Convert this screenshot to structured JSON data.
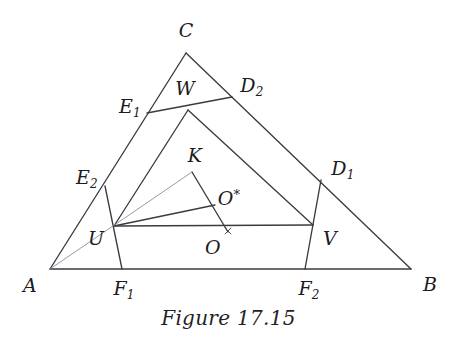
{
  "figure": {
    "caption": "Figure 17.15",
    "background_color": "#ffffff",
    "stroke_color": "#3a3a42",
    "light_stroke_color": "#8d8d96",
    "label_color": "#1b1b20"
  },
  "labels": {
    "A": "A",
    "B": "B",
    "C": "C",
    "U": "U",
    "V": "V",
    "W": "W",
    "K": "K",
    "O": "O",
    "O_star_base": "O",
    "O_star_mark": "*",
    "E1_base": "E",
    "E1_sub": "1",
    "E2_base": "E",
    "E2_sub": "2",
    "D1_base": "D",
    "D1_sub": "1",
    "D2_base": "D",
    "D2_sub": "2",
    "F1_base": "F",
    "F1_sub": "1",
    "F2_base": "F",
    "F2_sub": "2"
  },
  "chart_data": {
    "type": "diagram",
    "title": "Figure 17.15",
    "points": {
      "A": {
        "x": 50,
        "y": 269
      },
      "B": {
        "x": 411,
        "y": 269
      },
      "C": {
        "x": 186,
        "y": 53
      },
      "U": {
        "x": 114,
        "y": 226
      },
      "V": {
        "x": 313,
        "y": 225
      },
      "W": {
        "x": 188,
        "y": 110
      },
      "K": {
        "x": 192,
        "y": 172
      },
      "O": {
        "x": 228,
        "y": 232
      },
      "Ostar": {
        "x": 215,
        "y": 205
      },
      "E1": {
        "x": 147,
        "y": 113
      },
      "E2": {
        "x": 105,
        "y": 186
      },
      "D1": {
        "x": 321,
        "y": 180
      },
      "D2": {
        "x": 232,
        "y": 97
      },
      "F1": {
        "x": 122,
        "y": 269
      },
      "F2": {
        "x": 305,
        "y": 269
      }
    },
    "segments": [
      {
        "name": "side-AB",
        "from": "A",
        "to": "B",
        "weight": "normal"
      },
      {
        "name": "side-AC",
        "from": "A",
        "to": "C",
        "weight": "normal"
      },
      {
        "name": "side-CB",
        "from": "C",
        "to": "B",
        "weight": "normal"
      },
      {
        "name": "chord-E1-D2",
        "from": "E1",
        "to": "D2",
        "weight": "normal"
      },
      {
        "name": "chord-U-V",
        "from": "U",
        "to": "V",
        "weight": "normal"
      },
      {
        "name": "chord-E2-F1",
        "from": "E2",
        "to": "F1",
        "weight": "normal"
      },
      {
        "name": "chord-D1-F2",
        "from": "D1",
        "to": "F2",
        "weight": "normal"
      },
      {
        "name": "segment-U-W",
        "from": "U",
        "to": "W",
        "weight": "normal"
      },
      {
        "name": "segment-W-V",
        "from": "W",
        "to": "V",
        "weight": "normal"
      },
      {
        "name": "segment-U-Ostar",
        "from": "U",
        "to": "Ostar",
        "weight": "normal"
      },
      {
        "name": "segment-K-O",
        "from": "K",
        "to": "O",
        "weight": "normal"
      },
      {
        "name": "segment-U-K-light",
        "from": "A",
        "to": "K",
        "weight": "light"
      }
    ],
    "marks": [
      {
        "name": "cross-mark-O",
        "x": 228,
        "y": 231
      }
    ],
    "label_positions": {
      "A": {
        "x": 30,
        "y": 285
      },
      "B": {
        "x": 430,
        "y": 284
      },
      "C": {
        "x": 186,
        "y": 30
      },
      "U": {
        "x": 96,
        "y": 238
      },
      "V": {
        "x": 330,
        "y": 238
      },
      "W": {
        "x": 185,
        "y": 88
      },
      "K": {
        "x": 195,
        "y": 155
      },
      "O": {
        "x": 213,
        "y": 247
      },
      "Ostar": {
        "x": 229,
        "y": 198
      },
      "E1": {
        "x": 130,
        "y": 106
      },
      "E2": {
        "x": 87,
        "y": 177
      },
      "D1": {
        "x": 343,
        "y": 168
      },
      "D2": {
        "x": 252,
        "y": 85
      },
      "F1": {
        "x": 124,
        "y": 288
      },
      "F2": {
        "x": 309,
        "y": 288
      }
    }
  }
}
